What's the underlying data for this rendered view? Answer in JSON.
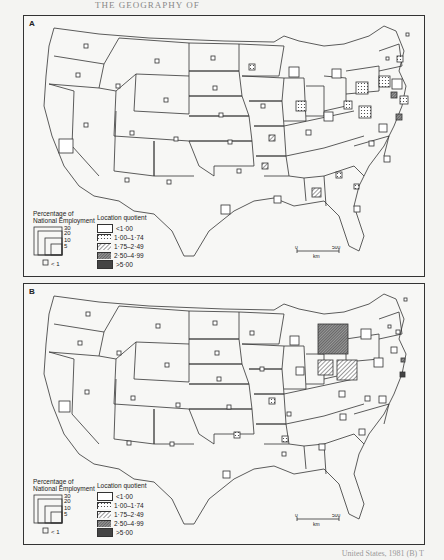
{
  "header": {
    "text": "THE GEOGRAPHY OF"
  },
  "patterns": {
    "lq1": "#ffffff",
    "lq2": "dots",
    "lq3": "hatch-light",
    "lq4": "hatch-dense",
    "lq5": "#444444"
  },
  "panels": [
    {
      "label": "A",
      "legend": {
        "size_title_1": "Percentage of",
        "size_title_2": "National Employment",
        "size_values": [
          "30",
          "20",
          "10",
          "5"
        ],
        "size_min_label": "< 1",
        "lq_title": "Location quotient",
        "lq_classes": [
          "<1·00",
          "1·00–1·74",
          "1·75–2·49",
          "2·50–4·99",
          ">5·00"
        ]
      },
      "scale": {
        "start": "0",
        "end": "500",
        "unit": "km"
      }
    },
    {
      "label": "B",
      "legend": {
        "size_title_1": "Percentage of",
        "size_title_2": "National Employment",
        "size_values": [
          "30",
          "20",
          "10",
          "5"
        ],
        "size_min_label": "< 1",
        "lq_title": "Location quotient",
        "lq_classes": [
          "<1·00",
          "1·00–1·74",
          "1·75–2·49",
          "2·50–4·99",
          ">5·00"
        ]
      },
      "scale": {
        "start": "0",
        "end": "500",
        "unit": "km"
      }
    }
  ],
  "caption": {
    "text": "United States, 1981 (B) T"
  }
}
